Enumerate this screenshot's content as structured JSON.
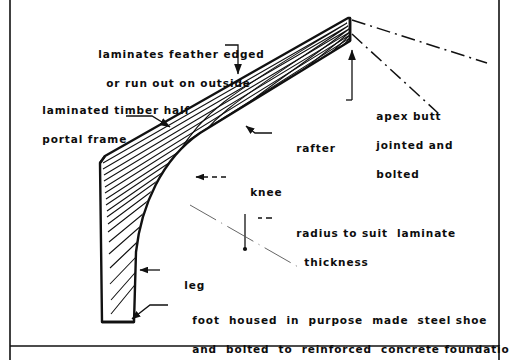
{
  "figure": {
    "kind": "engineering-drawing",
    "subject": "laminated timber half portal frame",
    "border_color": "#111111",
    "line_color": "#111111",
    "background_color": "#ffffff"
  },
  "annotations": {
    "laminates_note": {
      "line1": "laminates feather edged",
      "line2": "or run out on outside",
      "leader": "arrow-down-to-rafter-top"
    },
    "frame_note": {
      "line1": "laminated timber half",
      "line2": "portal frame",
      "leader": "arrow-right-to-knee-top"
    },
    "apex_note": {
      "line1": "apex butt",
      "line2": "jointed and",
      "line3": "bolted",
      "leader": "arrow-up-to-apex"
    },
    "rafter_note": {
      "line1": "rafter",
      "leader": "arrow-left-to-rafter"
    },
    "knee_note": {
      "line1": "knee",
      "leader": "arrow-left-to-knee"
    },
    "radius_note": {
      "line1": "radius to suit  laminate",
      "line2": "thickness",
      "leader": "stepped-leader-to-radius-line"
    },
    "leg_note": {
      "line1": "leg",
      "leader": "arrow-left-to-leg"
    },
    "foot_note": {
      "line1": "foot  housed  in  purpose  made  steel shoe",
      "line2": "and  bolted  to  reinforced  concrete foundation",
      "leader": "leader-to-foot"
    }
  },
  "geometry": {
    "apex_x": 350,
    "apex_top_y": 18,
    "apex_bottom_y": 41,
    "leg_base_y": 322,
    "leg_left_x": 100,
    "lamination_count": 14,
    "mirror_lines": 2
  }
}
